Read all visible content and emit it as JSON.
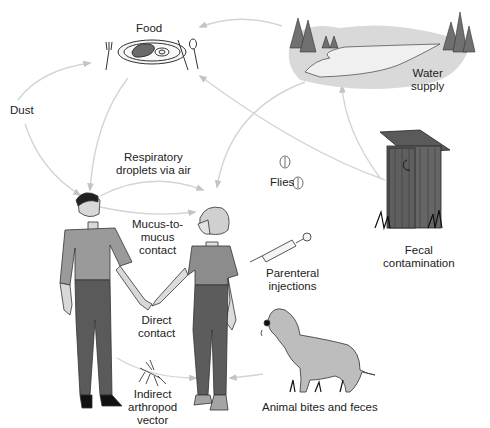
{
  "diagram": {
    "type": "disease-transmission-routes",
    "colors": {
      "arrow": "#c8c8c8",
      "figure_fill": "#8a8a8a",
      "figure_dark": "#4a4a4a",
      "skin": "#d8d8d8",
      "water": "#e6e6e6",
      "tree": "#6e6e6e",
      "text": "#222222"
    },
    "labels": {
      "food": "Food",
      "water_supply": [
        "Water",
        "supply"
      ],
      "dust": "Dust",
      "respiratory": [
        "Respiratory",
        "droplets via air"
      ],
      "flies": "Flies",
      "fecal": [
        "Fecal",
        "contamination"
      ],
      "mucus": [
        "Mucus-to-",
        "mucus",
        "contact"
      ],
      "parenteral": [
        "Parenteral",
        "injections"
      ],
      "direct": [
        "Direct",
        "contact"
      ],
      "animal": "Animal bites and feces",
      "arthropod": [
        "Indirect",
        "arthropod",
        "vector"
      ]
    },
    "nodes": [
      {
        "id": "food",
        "icon": "plate-with-fork-knife-spoon"
      },
      {
        "id": "water_supply",
        "icon": "lake-with-trees"
      },
      {
        "id": "outhouse",
        "icon": "outhouse"
      },
      {
        "id": "flies",
        "icon": "fly"
      },
      {
        "id": "syringe",
        "icon": "syringe"
      },
      {
        "id": "dog",
        "icon": "dog"
      },
      {
        "id": "mosquito",
        "icon": "mosquito"
      },
      {
        "id": "man",
        "icon": "man-figure"
      },
      {
        "id": "woman",
        "icon": "woman-figure"
      }
    ],
    "arrows": [
      {
        "from": "water_supply",
        "to": "food"
      },
      {
        "from": "dust",
        "to": "food"
      },
      {
        "from": "dust",
        "to": "man"
      },
      {
        "from": "food",
        "to": "man"
      },
      {
        "from": "outhouse",
        "to": "food"
      },
      {
        "from": "outhouse",
        "to": "water_supply"
      },
      {
        "from": "water_supply",
        "to": "woman"
      },
      {
        "from": "man",
        "to": "woman",
        "via": "respiratory droplets"
      },
      {
        "from": "man",
        "to": "woman",
        "via": "mucus-to-mucus"
      },
      {
        "from": "mosquito",
        "to": "woman"
      },
      {
        "from": "dog",
        "to": "woman"
      }
    ]
  }
}
